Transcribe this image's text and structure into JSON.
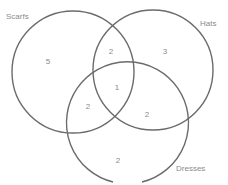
{
  "diagram": {
    "type": "venn",
    "sets": [
      {
        "name": "Scarfs",
        "label": "Scarfs"
      },
      {
        "name": "Hats",
        "label": "Hats"
      },
      {
        "name": "Dresses",
        "label": "Dresses"
      }
    ],
    "regions": {
      "scarfs_only": "5",
      "hats_only": "3",
      "dresses_only": "2",
      "scarfs_hats": "2",
      "scarfs_dresses": "2",
      "hats_dresses": "2",
      "all_three": "1"
    },
    "stroke_color": "#6b6b6b",
    "text_color": "#8a8a8a"
  }
}
